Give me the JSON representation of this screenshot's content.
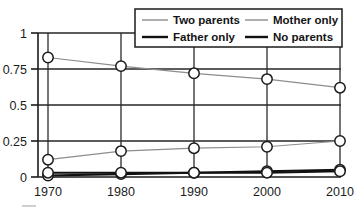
{
  "chart_data": {
    "type": "line",
    "title": "",
    "subtitle": "",
    "xlabel": "",
    "ylabel": "",
    "x": [
      1970,
      1980,
      1990,
      2000,
      2010
    ],
    "xtick_labels": [
      "1970",
      "1980",
      "1990",
      "2000",
      "2010"
    ],
    "ytick_labels": [
      "0",
      "0.25",
      "0.5",
      "0.75",
      "1"
    ],
    "ytick_values": [
      0,
      0.25,
      0.5,
      0.75,
      1
    ],
    "ylim": [
      0,
      1
    ],
    "xlim": [
      1970,
      2010
    ],
    "grid": "horizontal-and-vertical",
    "legend_position": "top-center",
    "markers": "open-circle",
    "series": [
      {
        "name": "Two parents",
        "color": "#8d8d8d",
        "style": "thin",
        "values": [
          0.83,
          0.77,
          0.72,
          0.68,
          0.62
        ]
      },
      {
        "name": "Mother only",
        "color": "#8d8d8d",
        "style": "thin",
        "values": [
          0.12,
          0.18,
          0.2,
          0.21,
          0.25
        ]
      },
      {
        "name": "Father only",
        "color": "#111111",
        "style": "thick",
        "values": [
          0.01,
          0.02,
          0.03,
          0.04,
          0.05
        ]
      },
      {
        "name": "No parents",
        "color": "#111111",
        "style": "thick",
        "values": [
          0.03,
          0.03,
          0.03,
          0.03,
          0.04
        ]
      }
    ]
  },
  "legend": {
    "entries": [
      {
        "label": "Two parents"
      },
      {
        "label": "Mother only"
      },
      {
        "label": "Father only"
      },
      {
        "label": "No parents"
      }
    ]
  },
  "axes": {
    "y_labels": [
      "1",
      "0.75",
      "0.5",
      "0.25",
      "0"
    ],
    "x_labels": [
      "1970",
      "1980",
      "1990",
      "2000",
      "2010"
    ]
  }
}
